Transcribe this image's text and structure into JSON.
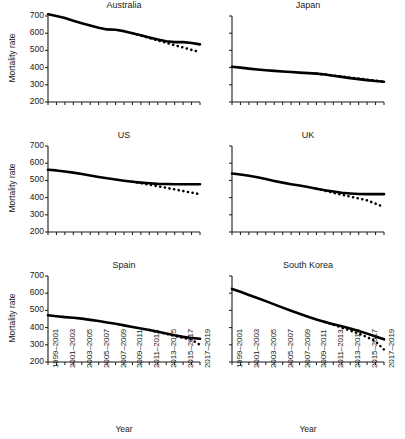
{
  "figure": {
    "axis_label_y": "Mortality rate",
    "axis_label_x": "Year",
    "y_ticks": [
      200,
      300,
      400,
      500,
      600,
      700
    ],
    "x_tick_labels": [
      "1999–2001",
      "2001–2003",
      "2003–2005",
      "2005–2007",
      "2007–2009",
      "2009–2011",
      "2011–2013",
      "2013–2015",
      "2015–2017",
      "2017–2019"
    ],
    "line_color": "#000000",
    "axis_color": "#1a1a1a",
    "background": "#ffffff"
  },
  "chart_data": [
    {
      "type": "line",
      "title": "Australia",
      "xlabel": "Year",
      "ylabel": "Mortality rate",
      "ylim": [
        200,
        700
      ],
      "grid": false,
      "legend": "none",
      "x": [
        "1999–2001",
        "2000–2002",
        "2001–2003",
        "2002–2004",
        "2003–2005",
        "2004–2006",
        "2005–2007",
        "2006–2008",
        "2007–2009",
        "2008–2010",
        "2009–2011",
        "2010–2012",
        "2011–2013",
        "2012–2014",
        "2013–2015",
        "2014–2016",
        "2015–2017",
        "2016–2018",
        "2017–2019"
      ],
      "series": [
        {
          "name": "Observed",
          "style": "solid",
          "values": [
            710,
            700,
            688,
            672,
            658,
            645,
            632,
            622,
            620,
            612,
            600,
            588,
            575,
            563,
            553,
            548,
            548,
            543,
            535
          ]
        },
        {
          "name": "Projected",
          "style": "dotted",
          "values": [
            null,
            null,
            null,
            null,
            null,
            null,
            null,
            null,
            null,
            null,
            600,
            586,
            572,
            558,
            544,
            530,
            517,
            503,
            490
          ]
        }
      ]
    },
    {
      "type": "line",
      "title": "Japan",
      "xlabel": "Year",
      "ylabel": "Mortality rate",
      "ylim": [
        200,
        700
      ],
      "grid": false,
      "legend": "none",
      "x": [
        "1999–2001",
        "2000–2002",
        "2001–2003",
        "2002–2004",
        "2003–2005",
        "2004–2006",
        "2005–2007",
        "2006–2008",
        "2007–2009",
        "2008–2010",
        "2009–2011",
        "2010–2012",
        "2011–2013",
        "2012–2014",
        "2013–2015",
        "2014–2016",
        "2015–2017",
        "2016–2018",
        "2017–2019"
      ],
      "series": [
        {
          "name": "Observed",
          "style": "solid",
          "values": [
            405,
            400,
            394,
            389,
            385,
            381,
            377,
            374,
            371,
            368,
            365,
            360,
            353,
            346,
            339,
            333,
            327,
            322,
            318
          ]
        },
        {
          "name": "Projected",
          "style": "dotted",
          "values": [
            null,
            null,
            null,
            null,
            null,
            null,
            null,
            null,
            null,
            null,
            365,
            360,
            354,
            348,
            342,
            336,
            330,
            324,
            318
          ]
        }
      ]
    },
    {
      "type": "line",
      "title": "US",
      "xlabel": "Year",
      "ylabel": "Mortality rate",
      "ylim": [
        200,
        700
      ],
      "grid": false,
      "legend": "none",
      "x": [
        "1999–2001",
        "2000–2002",
        "2001–2003",
        "2002–2004",
        "2003–2005",
        "2004–2006",
        "2005–2007",
        "2006–2008",
        "2007–2009",
        "2008–2010",
        "2009–2011",
        "2010–2012",
        "2011–2013",
        "2012–2014",
        "2013–2015",
        "2014–2016",
        "2015–2017",
        "2016–2018",
        "2017–2019"
      ],
      "series": [
        {
          "name": "Observed",
          "style": "solid",
          "values": [
            562,
            558,
            552,
            545,
            537,
            528,
            520,
            512,
            505,
            498,
            492,
            487,
            483,
            480,
            479,
            478,
            478,
            478,
            478
          ]
        },
        {
          "name": "Projected",
          "style": "dotted",
          "values": [
            null,
            null,
            null,
            null,
            null,
            null,
            null,
            null,
            null,
            null,
            492,
            484,
            475,
            466,
            457,
            448,
            438,
            429,
            420
          ]
        }
      ]
    },
    {
      "type": "line",
      "title": "UK",
      "xlabel": "Year",
      "ylabel": "Mortality rate",
      "ylim": [
        200,
        700
      ],
      "grid": false,
      "legend": "none",
      "x": [
        "1999–2001",
        "2000–2002",
        "2001–2003",
        "2002–2004",
        "2003–2005",
        "2004–2006",
        "2005–2007",
        "2006–2008",
        "2007–2009",
        "2008–2010",
        "2009–2011",
        "2010–2012",
        "2011–2013",
        "2012–2014",
        "2013–2015",
        "2014–2016",
        "2015–2017",
        "2016–2018",
        "2017–2019"
      ],
      "series": [
        {
          "name": "Observed",
          "style": "solid",
          "values": [
            540,
            534,
            527,
            518,
            508,
            497,
            487,
            478,
            470,
            462,
            452,
            443,
            435,
            428,
            424,
            421,
            420,
            420,
            420
          ]
        },
        {
          "name": "Projected",
          "style": "dotted",
          "values": [
            null,
            null,
            null,
            null,
            null,
            null,
            null,
            null,
            null,
            null,
            452,
            440,
            428,
            417,
            406,
            395,
            384,
            365,
            345
          ]
        }
      ]
    },
    {
      "type": "line",
      "title": "Spain",
      "xlabel": "Year",
      "ylabel": "Mortality rate",
      "ylim": [
        200,
        700
      ],
      "grid": false,
      "legend": "none",
      "x": [
        "1999–2001",
        "2000–2002",
        "2001–2003",
        "2002–2004",
        "2003–2005",
        "2004–2006",
        "2005–2007",
        "2006–2008",
        "2007–2009",
        "2008–2010",
        "2009–2011",
        "2010–2012",
        "2011–2013",
        "2012–2014",
        "2013–2015",
        "2014–2016",
        "2015–2017",
        "2016–2018",
        "2017–2019"
      ],
      "series": [
        {
          "name": "Observed",
          "style": "solid",
          "values": [
            472,
            466,
            461,
            457,
            452,
            445,
            438,
            430,
            422,
            413,
            404,
            395,
            386,
            376,
            366,
            355,
            346,
            340,
            335
          ]
        },
        {
          "name": "Projected",
          "style": "dotted",
          "values": [
            null,
            null,
            null,
            null,
            null,
            null,
            null,
            null,
            null,
            null,
            null,
            null,
            386,
            375,
            364,
            352,
            340,
            330,
            300
          ]
        }
      ]
    },
    {
      "type": "line",
      "title": "South Korea",
      "xlabel": "Year",
      "ylabel": "Mortality rate",
      "ylim": [
        200,
        700
      ],
      "grid": false,
      "legend": "none",
      "x": [
        "1999–2001",
        "2000–2002",
        "2001–2003",
        "2002–2004",
        "2003–2005",
        "2004–2006",
        "2005–2007",
        "2006–2008",
        "2007–2009",
        "2008–2010",
        "2009–2011",
        "2010–2012",
        "2011–2013",
        "2012–2014",
        "2013–2015",
        "2014–2016",
        "2015–2017",
        "2016–2018",
        "2017–2019"
      ],
      "series": [
        {
          "name": "Observed",
          "style": "solid",
          "values": [
            625,
            608,
            590,
            572,
            554,
            535,
            516,
            498,
            480,
            463,
            447,
            433,
            420,
            408,
            395,
            380,
            365,
            348,
            332
          ]
        },
        {
          "name": "Projected",
          "style": "dotted",
          "values": [
            null,
            null,
            null,
            null,
            null,
            null,
            null,
            null,
            null,
            null,
            null,
            433,
            417,
            400,
            383,
            365,
            345,
            320,
            272
          ]
        }
      ]
    }
  ]
}
